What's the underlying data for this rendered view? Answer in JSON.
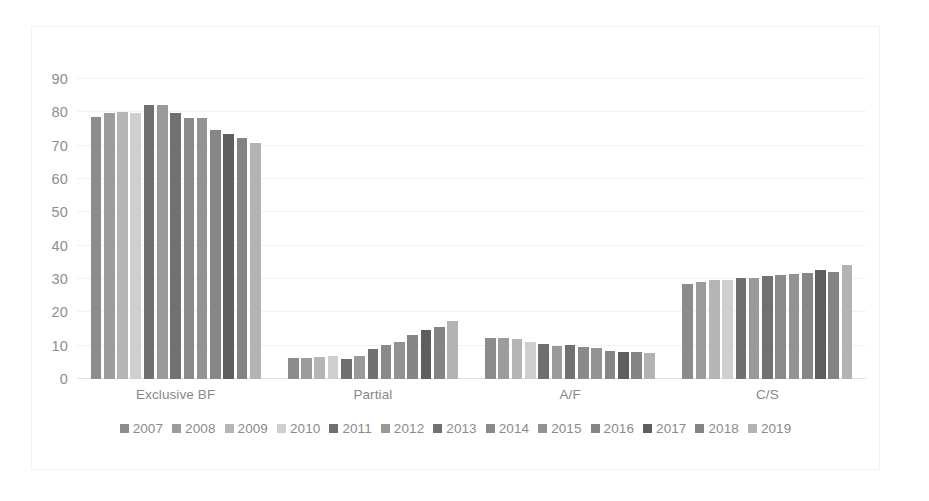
{
  "chart_data": {
    "type": "bar",
    "title": "",
    "xlabel": "",
    "ylabel": "",
    "ylim": [
      0,
      90
    ],
    "yticks": [
      0,
      10,
      20,
      30,
      40,
      50,
      60,
      70,
      80,
      90
    ],
    "grid": true,
    "legend_position": "bottom",
    "categories": [
      "Exclusive BF",
      "Partial",
      "A/F",
      "C/S"
    ],
    "series": [
      {
        "name": "2007",
        "color": "#8c8c8c",
        "values": [
          78.6,
          6.3,
          12.4,
          28.5
        ]
      },
      {
        "name": "2008",
        "color": "#9c9c9c",
        "values": [
          79.8,
          6.3,
          12.4,
          29.2
        ]
      },
      {
        "name": "2009",
        "color": "#b5b5b5",
        "values": [
          80.2,
          6.6,
          12.0,
          29.6
        ]
      },
      {
        "name": "2010",
        "color": "#cfcfcf",
        "values": [
          79.8,
          7.0,
          11.1,
          29.6
        ]
      },
      {
        "name": "2011",
        "color": "#6f6f6f",
        "values": [
          82.1,
          6.0,
          10.4,
          30.4
        ]
      },
      {
        "name": "2012",
        "color": "#9a9a9a",
        "values": [
          82.1,
          6.9,
          10.0,
          30.4
        ]
      },
      {
        "name": "2013",
        "color": "#717171",
        "values": [
          79.7,
          8.9,
          10.2,
          30.8
        ]
      },
      {
        "name": "2014",
        "color": "#8a8a8a",
        "values": [
          78.4,
          10.2,
          9.6,
          31.1
        ]
      },
      {
        "name": "2015",
        "color": "#939393",
        "values": [
          78.4,
          11.2,
          9.4,
          31.6
        ]
      },
      {
        "name": "2016",
        "color": "#868686",
        "values": [
          74.7,
          13.2,
          8.4,
          31.8
        ]
      },
      {
        "name": "2017",
        "color": "#5e5e5e",
        "values": [
          73.5,
          14.8,
          8.2,
          32.8
        ]
      },
      {
        "name": "2018",
        "color": "#848484",
        "values": [
          72.3,
          15.6,
          8.2,
          32.1
        ]
      },
      {
        "name": "2019",
        "color": "#b3b3b3",
        "values": [
          70.9,
          17.3,
          7.9,
          34.2
        ]
      }
    ]
  },
  "axis": {
    "tick_labels": [
      "90",
      "80",
      "70",
      "60",
      "50",
      "40",
      "30",
      "20",
      "10",
      "0"
    ]
  }
}
